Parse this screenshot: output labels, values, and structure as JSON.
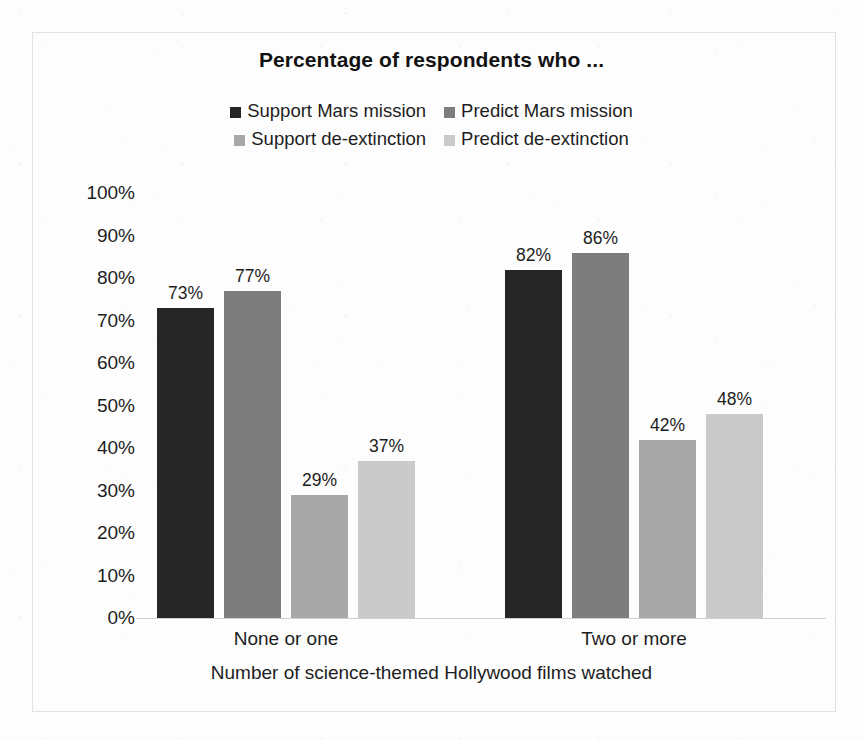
{
  "chart_data": {
    "type": "bar",
    "title": "Percentage of respondents who ...",
    "xlabel": "Number of science-themed Hollywood films watched",
    "ylabel": "",
    "categories": [
      "None or one",
      "Two or more"
    ],
    "series": [
      {
        "name": "Support Mars mission",
        "values": [
          73,
          77
        ],
        "color": "#262626",
        "labels": [
          "73%",
          "77%"
        ]
      },
      {
        "name": "Predict Mars mission",
        "values": [
          77,
          86
        ],
        "color": "#7d7d7d",
        "labels": [
          "77%",
          "86%"
        ]
      },
      {
        "name": "Support de-extinction",
        "values": [
          29,
          42
        ],
        "color": "#a8a8a8",
        "labels": [
          "29%",
          "42%"
        ]
      },
      {
        "name": "Predict de-extinction",
        "values": [
          37,
          48
        ],
        "color": "#cacaca",
        "labels": [
          "37%",
          "48%"
        ]
      }
    ],
    "group_values": {
      "none_or_one": {
        "support_mars": 73,
        "predict_mars": 77,
        "support_deextinction": 29,
        "predict_deextinction": 37
      },
      "two_or_more": {
        "support_mars": 82,
        "predict_mars": 86,
        "support_deextinction": 42,
        "predict_deextinction": 48
      }
    },
    "ylim": [
      0,
      100
    ],
    "ytick_labels": [
      "100%",
      "90%",
      "80%",
      "70%",
      "60%",
      "50%",
      "40%",
      "30%",
      "20%",
      "10%",
      "0%"
    ],
    "ytick_values": [
      100,
      90,
      80,
      70,
      60,
      50,
      40,
      30,
      20,
      10,
      0
    ],
    "grid": false,
    "legend_position": "top-center",
    "bars": [
      {
        "group": "None or one",
        "series": "Support Mars mission",
        "value": 73,
        "label": "73%",
        "color": "#262626"
      },
      {
        "group": "None or one",
        "series": "Predict Mars mission",
        "value": 77,
        "label": "77%",
        "color": "#7d7d7d"
      },
      {
        "group": "None or one",
        "series": "Support de-extinction",
        "value": 29,
        "label": "29%",
        "color": "#a8a8a8"
      },
      {
        "group": "None or one",
        "series": "Predict de-extinction",
        "value": 37,
        "label": "37%",
        "color": "#cacaca"
      },
      {
        "group": "Two or more",
        "series": "Support Mars mission",
        "value": 82,
        "label": "82%",
        "color": "#262626"
      },
      {
        "group": "Two or more",
        "series": "Predict Mars mission",
        "value": 86,
        "label": "86%",
        "color": "#7d7d7d"
      },
      {
        "group": "Two or more",
        "series": "Support de-extinction",
        "value": 42,
        "label": "42%",
        "color": "#a8a8a8"
      },
      {
        "group": "Two or more",
        "series": "Predict de-extinction",
        "value": 48,
        "label": "48%",
        "color": "#cacaca"
      }
    ]
  },
  "legend": {
    "row1": [
      {
        "label": "Support Mars mission",
        "color": "#262626"
      },
      {
        "label": "Predict Mars mission",
        "color": "#7d7d7d"
      }
    ],
    "row2": [
      {
        "label": "Support de-extinction",
        "color": "#a8a8a8"
      },
      {
        "label": "Predict de-extinction",
        "color": "#cacaca"
      }
    ]
  },
  "colors": {
    "background": "#fdfdfd",
    "frame": "#e2e2e2",
    "baseline": "#cfcfcf",
    "text": "#1d1d1d",
    "series_1": "#262626",
    "series_2": "#7d7d7d",
    "series_3": "#a8a8a8",
    "series_4": "#cacaca"
  }
}
